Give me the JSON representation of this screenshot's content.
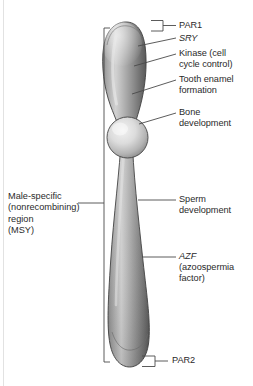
{
  "figure": {
    "colors": {
      "chromosome_light": "#e8e8e8",
      "chromosome_mid": "#9a9a9a",
      "chromosome_dark": "#585858",
      "outline": "#3d3d3d",
      "text": "#2a2a2a",
      "leader_line": "#4a4a4a",
      "page_rule": "#e2e2e2",
      "background": "#ffffff"
    }
  },
  "left_label": {
    "name": "male-specific-region",
    "lines": "Male-specific\n(nonrecombining)\nregion\n(MSY)",
    "text": "Male-specific (nonrecombining) region (MSY)"
  },
  "right_labels": [
    {
      "name": "par1",
      "text": "PAR1",
      "italic": false,
      "lines": "PAR1"
    },
    {
      "name": "sry",
      "text": "SRY",
      "italic": true,
      "lines": "SRY"
    },
    {
      "name": "kinase",
      "text": "Kinase (cell cycle control)",
      "italic": false,
      "lines": "Kinase (cell\ncycle control)"
    },
    {
      "name": "tooth-enamel",
      "text": "Tooth enamel formation",
      "italic": false,
      "lines": "Tooth enamel\nformation"
    },
    {
      "name": "bone-development",
      "text": "Bone development",
      "italic": false,
      "lines": "Bone\ndevelopment"
    },
    {
      "name": "sperm-development",
      "text": "Sperm development",
      "italic": false,
      "lines": "Sperm\ndevelopment"
    },
    {
      "name": "azf",
      "text": "AZF (azoospermia factor)",
      "italic": false,
      "lines": ""
    },
    {
      "name": "par2",
      "text": "PAR2",
      "italic": false,
      "lines": "PAR2"
    }
  ],
  "azf_label": {
    "gene": "AZF",
    "detail": "(azoospermia\nfactor)"
  },
  "regions": {
    "par1": "PAR1",
    "par2": "PAR2",
    "msy": "MSY"
  }
}
